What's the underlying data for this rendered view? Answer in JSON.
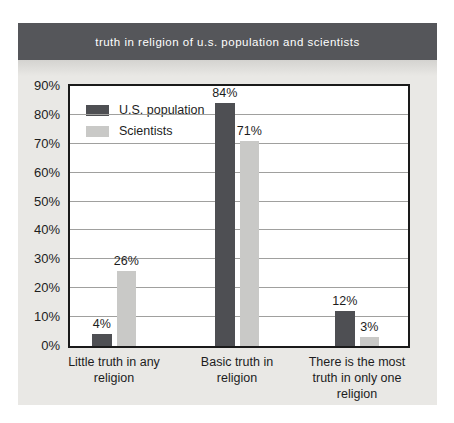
{
  "header": {
    "title": "truth in religion of u.s. population and scientists"
  },
  "colors": {
    "header_bg": "#55565a",
    "panel_bg": "#e9e8e5",
    "plot_bg": "#ffffff",
    "plot_border": "#1a1a1a",
    "gridline": "#a0a09e",
    "text": "#1d1d1d",
    "us_population_bar": "#4e4f53",
    "scientists_bar": "#c9c9c7"
  },
  "chart_data": {
    "type": "bar",
    "title": "truth in religion of u.s. population and scientists",
    "categories": [
      "Little truth in any religion",
      "Basic truth in religion",
      "There is the most truth in only one religion"
    ],
    "category_label_lines": [
      [
        "Little truth in any",
        "religion"
      ],
      [
        "Basic truth in",
        "religion"
      ],
      [
        "There is the most",
        "truth in only one",
        "religion"
      ]
    ],
    "series": [
      {
        "name": "U.S. population",
        "color": "#4e4f53",
        "values": [
          4,
          84,
          12
        ],
        "value_labels": [
          "4%",
          "84%",
          "12%"
        ]
      },
      {
        "name": "Scientists",
        "color": "#c9c9c7",
        "values": [
          26,
          71,
          3
        ],
        "value_labels": [
          "26%",
          "71%",
          "3%"
        ]
      }
    ],
    "xlabel": "",
    "ylabel": "",
    "y_ticks": [
      "0%",
      "10%",
      "20%",
      "30%",
      "40%",
      "50%",
      "60%",
      "70%",
      "80%",
      "90%"
    ],
    "ylim": [
      0,
      90
    ],
    "grid": true,
    "legend_position": "top-left"
  }
}
